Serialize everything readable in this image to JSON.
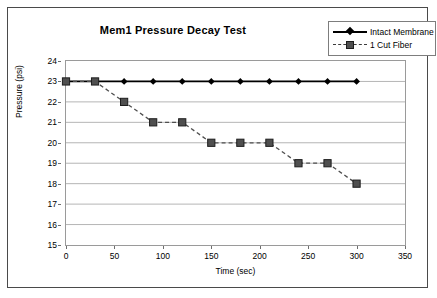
{
  "chart_data": {
    "type": "line",
    "title": "Mem1 Pressure Decay Test",
    "xlabel": "Time (sec)",
    "ylabel": "Pressure (psi)",
    "xlim": [
      0,
      350
    ],
    "ylim": [
      15,
      24
    ],
    "xticks": [
      0,
      50,
      100,
      150,
      200,
      250,
      300,
      350
    ],
    "yticks": [
      15,
      16,
      17,
      18,
      19,
      20,
      21,
      22,
      23,
      24
    ],
    "grid": "horizontal",
    "legend_position": "top-right",
    "series": [
      {
        "name": "Intact Membrane",
        "marker": "diamond",
        "line_style": "solid",
        "color": "#000000",
        "x": [
          0,
          30,
          60,
          90,
          120,
          150,
          180,
          210,
          240,
          270,
          300
        ],
        "values": [
          23,
          23,
          23,
          23,
          23,
          23,
          23,
          23,
          23,
          23,
          23
        ]
      },
      {
        "name": "1 Cut Fiber",
        "marker": "square",
        "line_style": "dashed",
        "color": "#4f4f4f",
        "x": [
          0,
          30,
          60,
          90,
          120,
          150,
          180,
          210,
          240,
          270,
          300
        ],
        "values": [
          23,
          23,
          22,
          21,
          21,
          20,
          20,
          20,
          19,
          19,
          18
        ]
      }
    ]
  },
  "legend": {
    "items": [
      {
        "label": "Intact Membrane"
      },
      {
        "label": "1 Cut Fiber"
      }
    ]
  }
}
